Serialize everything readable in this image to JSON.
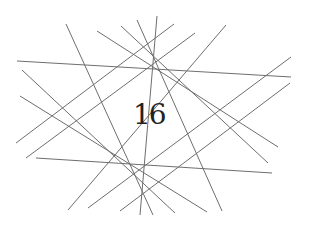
{
  "diagram": {
    "label": "16",
    "line_color": "#6e6e6e",
    "line_width": 1,
    "lines": [
      {
        "x1": 17,
        "y1": 61,
        "x2": 291,
        "y2": 77
      },
      {
        "x1": 36,
        "y1": 158,
        "x2": 272,
        "y2": 173
      },
      {
        "x1": 66,
        "y1": 24,
        "x2": 153,
        "y2": 215
      },
      {
        "x1": 226,
        "y1": 25,
        "x2": 68,
        "y2": 210
      },
      {
        "x1": 97,
        "y1": 31,
        "x2": 278,
        "y2": 147
      },
      {
        "x1": 121,
        "y1": 26,
        "x2": 268,
        "y2": 163
      },
      {
        "x1": 137,
        "y1": 20,
        "x2": 222,
        "y2": 211
      },
      {
        "x1": 157,
        "y1": 16,
        "x2": 140,
        "y2": 215
      },
      {
        "x1": 174,
        "y1": 24,
        "x2": 16,
        "y2": 143
      },
      {
        "x1": 195,
        "y1": 33,
        "x2": 26,
        "y2": 158
      },
      {
        "x1": 291,
        "y1": 57,
        "x2": 88,
        "y2": 208
      },
      {
        "x1": 290,
        "y1": 83,
        "x2": 120,
        "y2": 211
      },
      {
        "x1": 22,
        "y1": 70,
        "x2": 175,
        "y2": 213
      },
      {
        "x1": 20,
        "y1": 96,
        "x2": 207,
        "y2": 212
      }
    ]
  }
}
